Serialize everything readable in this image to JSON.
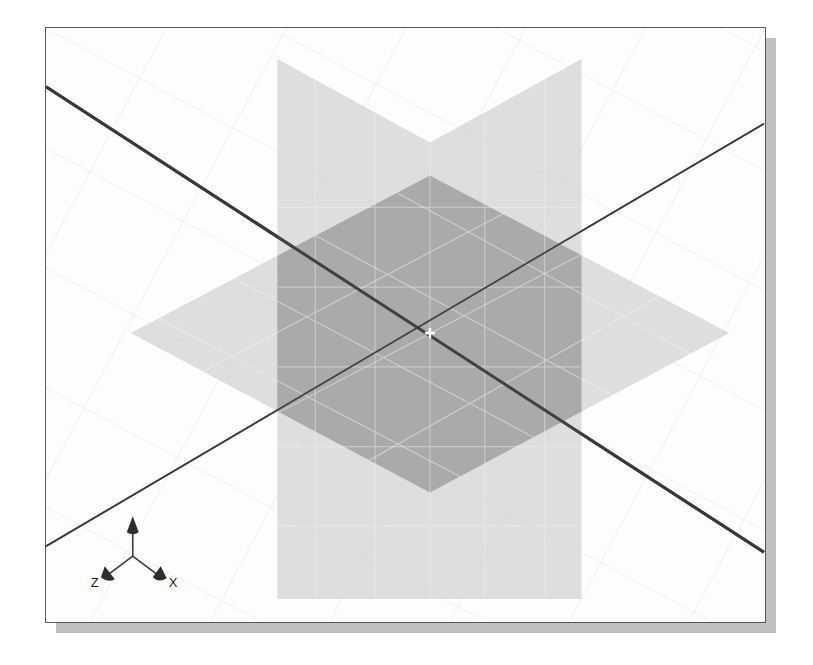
{
  "window": {
    "title": "3D Viewport",
    "panel_border_color": "#565656",
    "panel_background": "#fdfdfd",
    "shadow_color": "#9a9a9a"
  },
  "viewport": {
    "width": 721,
    "height": 596,
    "background_grid": {
      "visible": true,
      "color": "#e4e4e4",
      "spacing": 75,
      "style": "isometric-diamond"
    },
    "origin": {
      "x": 385,
      "y": 306,
      "marker": "origin-cross",
      "marker_color": "#ffffff"
    }
  },
  "axes": {
    "line_color": "#3a3a3a",
    "items": [
      {
        "name": "x-axis",
        "label": "X",
        "from": {
          "x": 0,
          "y": 59
        },
        "to": {
          "x": 720,
          "y": 526
        }
      },
      {
        "name": "z-axis",
        "label": "Z",
        "from": {
          "x": 720,
          "y": 96
        },
        "to": {
          "x": 0,
          "y": 520
        }
      }
    ]
  },
  "planes": [
    {
      "name": "horizontal-plane",
      "label": "XZ ground plane",
      "fill": "#c9c9c9",
      "opacity": 0.55,
      "shape": "diamond",
      "points": "85,306 385,148 685,306 385,466"
    },
    {
      "name": "vertical-plane",
      "label": "XY vertical plane",
      "fill": "#c9c9c9",
      "opacity": 0.55,
      "shape": "hexagon",
      "points": "232,31 385,115 537,31 537,573 385,573 232,573"
    }
  ],
  "overlap": {
    "name": "plane-overlap-region",
    "fill": "#7f7f7f",
    "opacity": 0.55,
    "description": "darker intersection of the two semi-transparent planes"
  },
  "triad": {
    "name": "axis-orientation-triad",
    "origin": {
      "x": 87,
      "y": 530
    },
    "arrows": [
      {
        "name": "triad-arrow-y",
        "axis": "Y",
        "label": "",
        "dx": 0,
        "dy": -35
      },
      {
        "name": "triad-arrow-z",
        "axis": "Z",
        "label": "Z",
        "dx": -26,
        "dy": 21
      },
      {
        "name": "triad-arrow-x",
        "axis": "X",
        "label": "X",
        "dx": 26,
        "dy": 21
      }
    ],
    "labels": {
      "x": "X",
      "y": "Y",
      "z": "Z"
    },
    "color": "#3a3a3a"
  }
}
